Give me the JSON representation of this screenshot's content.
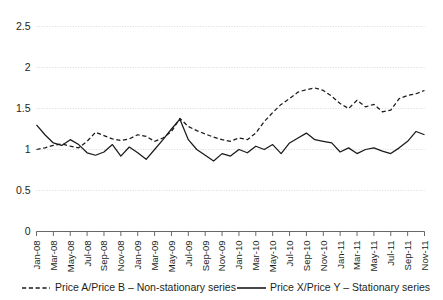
{
  "chart_data": {
    "type": "line",
    "title": "",
    "xlabel": "",
    "ylabel": "",
    "ylim": [
      0,
      2.5
    ],
    "yticks": [
      0,
      0.5,
      1,
      1.5,
      2,
      2.5
    ],
    "ytick_labels": [
      "0",
      "0.5",
      "1",
      "1.5",
      "2",
      "2.5"
    ],
    "grid": true,
    "legend_position": "bottom",
    "x": [
      "Jan-08",
      "Feb-08",
      "Mar-08",
      "Apr-08",
      "May-08",
      "Jun-08",
      "Jul-08",
      "Aug-08",
      "Sep-08",
      "Oct-08",
      "Nov-08",
      "Dec-08",
      "Jan-09",
      "Feb-09",
      "Mar-09",
      "Apr-09",
      "May-09",
      "Jun-09",
      "Jul-09",
      "Aug-09",
      "Sep-09",
      "Oct-09",
      "Nov-09",
      "Dec-09",
      "Jan-10",
      "Feb-10",
      "Mar-10",
      "Apr-10",
      "May-10",
      "Jun-10",
      "Jul-10",
      "Aug-10",
      "Sep-10",
      "Oct-10",
      "Nov-10",
      "Dec-10",
      "Jan-11",
      "Feb-11",
      "Mar-11",
      "Apr-11",
      "May-11",
      "Jun-11",
      "Jul-11",
      "Aug-11",
      "Sep-11",
      "Oct-11",
      "Nov-11"
    ],
    "xtick_labels": [
      "Jan-08",
      "Mar-08",
      "May-08",
      "Jul-08",
      "Sep-08",
      "Nov-08",
      "Jan-09",
      "Mar-09",
      "May-09",
      "Jul-09",
      "Sep-09",
      "Nov-09",
      "Jan-10",
      "Mar-10",
      "May-10",
      "Jul-10",
      "Sep-10",
      "Nov-10",
      "Jan-11",
      "Mar-11",
      "May-11",
      "Jul-11",
      "Sep-11",
      "Nov-11"
    ],
    "series": [
      {
        "name": "Price A/Price B – Non-stationary series",
        "style": "dashed",
        "color": "#1a1a1a",
        "values": [
          1.0,
          1.02,
          1.05,
          1.07,
          1.04,
          1.02,
          1.1,
          1.21,
          1.17,
          1.13,
          1.11,
          1.13,
          1.18,
          1.16,
          1.1,
          1.14,
          1.22,
          1.38,
          1.28,
          1.23,
          1.19,
          1.15,
          1.12,
          1.1,
          1.14,
          1.12,
          1.2,
          1.34,
          1.45,
          1.55,
          1.62,
          1.7,
          1.73,
          1.75,
          1.72,
          1.65,
          1.56,
          1.5,
          1.6,
          1.52,
          1.55,
          1.46,
          1.48,
          1.62,
          1.66,
          1.68,
          1.72
        ]
      },
      {
        "name": "Price X/Price Y – Stationary series",
        "style": "solid",
        "color": "#1a1a1a",
        "values": [
          1.3,
          1.18,
          1.08,
          1.05,
          1.12,
          1.06,
          0.96,
          0.93,
          0.97,
          1.06,
          0.92,
          1.03,
          0.96,
          0.88,
          1.0,
          1.12,
          1.25,
          1.37,
          1.12,
          1.0,
          0.93,
          0.86,
          0.95,
          0.92,
          1.0,
          0.96,
          1.04,
          1.0,
          1.06,
          0.95,
          1.08,
          1.14,
          1.2,
          1.12,
          1.1,
          1.08,
          0.97,
          1.02,
          0.95,
          1.0,
          1.02,
          0.98,
          0.95,
          1.02,
          1.1,
          1.22,
          1.18
        ]
      }
    ]
  },
  "legend": {
    "items": [
      {
        "label": "Price A/Price B – Non-stationary series",
        "style": "dashed"
      },
      {
        "label": "Price X/Price Y – Stationary series",
        "style": "solid"
      }
    ]
  },
  "colors": {
    "series_line": "#1a1a1a",
    "gridline": "#cfcfcf",
    "axis": "#58585a",
    "text": "#231f20",
    "background": "#ffffff"
  }
}
